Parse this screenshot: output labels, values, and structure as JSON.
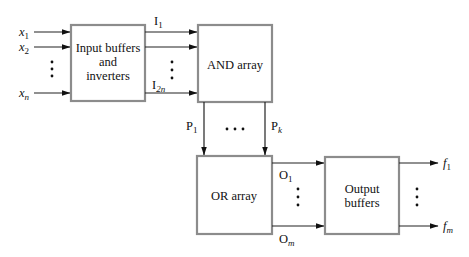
{
  "diagram": {
    "type": "block-diagram",
    "title": "",
    "blocks": {
      "input": {
        "line1": "Input buffers",
        "line2": "and",
        "line3": "inverters"
      },
      "and": {
        "label": "AND array"
      },
      "or": {
        "label": "OR array"
      },
      "output": {
        "line1": "Output",
        "line2": "buffers"
      }
    },
    "inputs": [
      {
        "base": "x",
        "sub": "1"
      },
      {
        "base": "x",
        "sub": "2"
      },
      {
        "base": "x",
        "sub": "n"
      }
    ],
    "buffered_signals": [
      {
        "base": "I",
        "sub": "1"
      },
      {
        "base": "I",
        "sub": "2n"
      }
    ],
    "product_terms": [
      {
        "base": "P",
        "sub": "1"
      },
      {
        "base": "P",
        "sub": "k"
      }
    ],
    "or_outputs": [
      {
        "base": "O",
        "sub": "1"
      },
      {
        "base": "O",
        "sub": "m"
      }
    ],
    "outputs": [
      {
        "base": "f",
        "sub": "1"
      },
      {
        "base": "f",
        "sub": "m"
      }
    ],
    "colors": {
      "box_border": "#8c8c8c",
      "wire": "#222222",
      "background": "#ffffff"
    }
  }
}
